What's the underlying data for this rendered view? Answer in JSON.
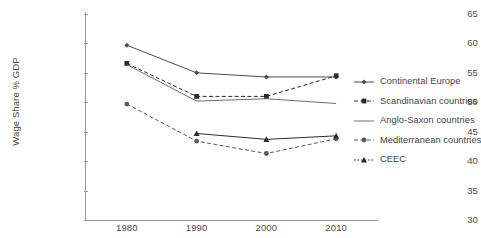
{
  "chart_data": {
    "type": "line",
    "title": "",
    "xlabel": "",
    "ylabel": "Wage Share % GDP",
    "x": [
      1980,
      1990,
      2000,
      2010
    ],
    "categories": [
      "1980",
      "1990",
      "2000",
      "2010"
    ],
    "xlim": [
      1974,
      2016
    ],
    "ylim": [
      30,
      65
    ],
    "ytick_labels": [
      "30",
      "35",
      "40",
      "45",
      "50",
      "55",
      "60",
      "65"
    ],
    "ytick_values": [
      30,
      35,
      40,
      45,
      50,
      55,
      60,
      65
    ],
    "xtick_labels": [
      "1980",
      "1990",
      "2000",
      "2010"
    ],
    "grid": false,
    "legend_position": "right",
    "series": [
      {
        "name": "Continental Europe",
        "marker": "diamond",
        "line_style": "solid",
        "color": "#4d4d4d",
        "x": [
          1980,
          1990,
          2000,
          2010
        ],
        "values": [
          59.7,
          55.0,
          54.3,
          54.3
        ]
      },
      {
        "name": "Scandinavian countries",
        "marker": "square",
        "line_style": "dashed",
        "color": "#2b2b2b",
        "x": [
          1980,
          1990,
          2000,
          2010
        ],
        "values": [
          56.6,
          51.0,
          51.0,
          54.5
        ]
      },
      {
        "name": "Anglo-Saxon countries",
        "marker": "none",
        "line_style": "solid",
        "color": "#6e6e6e",
        "x": [
          1980,
          1990,
          2000,
          2010
        ],
        "values": [
          56.4,
          50.2,
          50.6,
          49.8
        ]
      },
      {
        "name": "Mediterranean countries",
        "marker": "circle",
        "line_style": "dashed",
        "color": "#5a5a5a",
        "x": [
          1980,
          1990,
          2000,
          2010
        ],
        "values": [
          49.7,
          43.4,
          41.3,
          43.8
        ]
      },
      {
        "name": "CEEC",
        "marker": "triangle",
        "line_style": "solid",
        "color": "#2b2b2b",
        "x": [
          1990,
          2000,
          2010
        ],
        "values": [
          44.7,
          43.7,
          44.3
        ]
      }
    ]
  },
  "axes": {
    "y_title": "Wage Share % GDP",
    "y_ticks": [
      "65",
      "60",
      "55",
      "50",
      "45",
      "40",
      "35",
      "30"
    ],
    "x_ticks": [
      "1980",
      "1990",
      "2000",
      "2010"
    ]
  },
  "legend": {
    "entries": [
      {
        "label": "Continental Europe",
        "marker": "diamond",
        "line_style": "solid"
      },
      {
        "label": "Scandinavian countries",
        "marker": "square",
        "line_style": "dashed"
      },
      {
        "label": "Anglo-Saxon countries",
        "marker": "none",
        "line_style": "solid"
      },
      {
        "label": "Mediterranean countries",
        "marker": "circle",
        "line_style": "dashed"
      },
      {
        "label": "CEEC",
        "marker": "triangle",
        "line_style": "dotted"
      }
    ]
  },
  "caption": ""
}
